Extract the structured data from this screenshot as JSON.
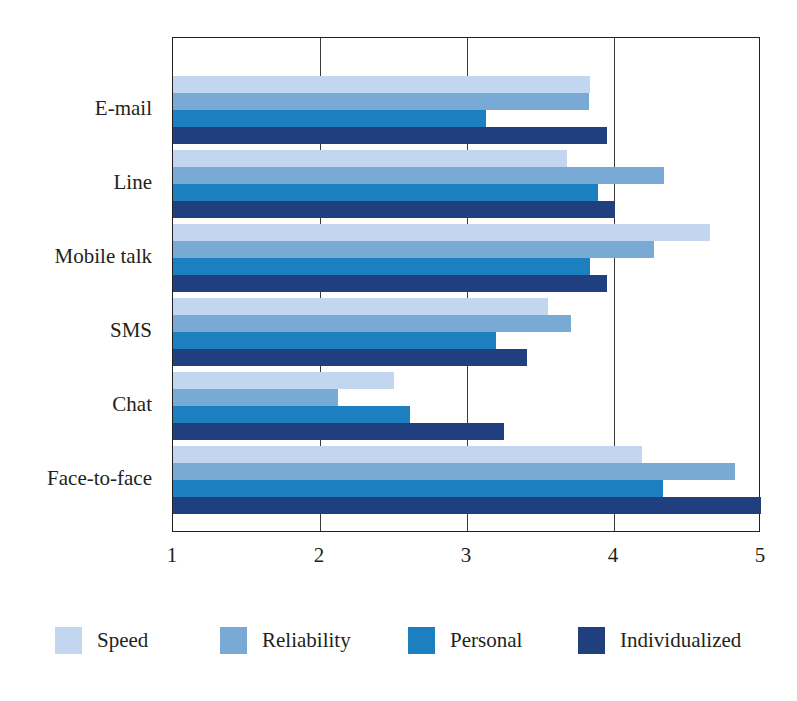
{
  "chart_data": {
    "type": "bar",
    "orientation": "horizontal",
    "title": "",
    "xlabel": "",
    "ylabel": "",
    "xlim": [
      1,
      5
    ],
    "xticks": [
      1,
      2,
      3,
      4,
      5
    ],
    "xtick_labels": [
      "1",
      "2",
      "3",
      "4",
      "5"
    ],
    "grid": true,
    "grid_axis": "x",
    "legend_position": "bottom",
    "categories": [
      "E-mail",
      "Line",
      "Mobile talk",
      "SMS",
      "Chat",
      "Face-to-face"
    ],
    "series": [
      {
        "name": "Speed",
        "color": "#c3d6ef",
        "values": [
          3.84,
          3.68,
          4.65,
          3.55,
          2.5,
          4.19
        ]
      },
      {
        "name": "Reliability",
        "color": "#79aad6",
        "values": [
          3.83,
          4.34,
          4.27,
          3.71,
          2.12,
          4.82
        ]
      },
      {
        "name": "Personal",
        "color": "#1b7fc0",
        "values": [
          3.13,
          3.89,
          3.84,
          3.2,
          2.61,
          4.33
        ]
      },
      {
        "name": "Individualized",
        "color": "#1f3f7f",
        "values": [
          3.95,
          4.01,
          3.95,
          3.41,
          3.25,
          5.0
        ]
      }
    ]
  },
  "axes": {
    "frame_color": "#231f20",
    "gridline_color": "#3a3a3a",
    "background": "#ffffff"
  }
}
